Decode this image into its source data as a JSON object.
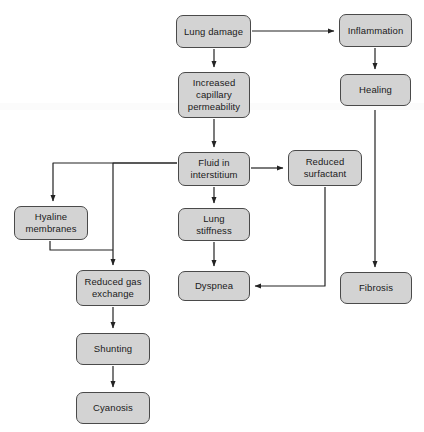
{
  "diagram": {
    "background_color": "#ffffff",
    "node_fill_color": "#d3d3d3",
    "node_border_color": "#4a4a4a",
    "edge_color": "#222222",
    "text_color": "#1a1a1a",
    "nodes": [
      {
        "id": "lung-damage",
        "label": "Lung damage",
        "x": 176,
        "y": 15,
        "w": 75,
        "h": 33
      },
      {
        "id": "inflammation",
        "label": "Inflammation",
        "x": 339,
        "y": 14,
        "w": 73,
        "h": 33
      },
      {
        "id": "increased-cap-perm",
        "label": "Increased\ncapillary\npermeability",
        "x": 178,
        "y": 72,
        "w": 72,
        "h": 46
      },
      {
        "id": "healing",
        "label": "Healing",
        "x": 340,
        "y": 74,
        "w": 71,
        "h": 32
      },
      {
        "id": "fluid-interstitium",
        "label": "Fluid in\ninterstitium",
        "x": 178,
        "y": 152,
        "w": 72,
        "h": 34
      },
      {
        "id": "reduced-surfactant",
        "label": "Reduced\nsurfactant",
        "x": 288,
        "y": 150,
        "w": 74,
        "h": 36
      },
      {
        "id": "hyaline-membranes",
        "label": "Hyaline\nmembranes",
        "x": 14,
        "y": 206,
        "w": 74,
        "h": 34
      },
      {
        "id": "lung-stiffness",
        "label": "Lung\nstiffness",
        "x": 178,
        "y": 208,
        "w": 72,
        "h": 33
      },
      {
        "id": "reduced-gas-exch",
        "label": "Reduced gas\nexchange",
        "x": 76,
        "y": 270,
        "w": 74,
        "h": 36
      },
      {
        "id": "dyspnea",
        "label": "Dyspnea",
        "x": 178,
        "y": 271,
        "w": 72,
        "h": 30
      },
      {
        "id": "fibrosis",
        "label": "Fibrosis",
        "x": 340,
        "y": 272,
        "w": 72,
        "h": 32
      },
      {
        "id": "shunting",
        "label": "Shunting",
        "x": 76,
        "y": 333,
        "w": 74,
        "h": 32
      },
      {
        "id": "cyanosis",
        "label": "Cyanosis",
        "x": 76,
        "y": 392,
        "w": 74,
        "h": 32
      }
    ],
    "edges": [
      {
        "id": "lung-damage-to-inflammation",
        "from": "lung-damage",
        "to": "inflammation",
        "points": "252,31 334,31",
        "arrow": true
      },
      {
        "id": "lung-damage-to-capillary",
        "from": "lung-damage",
        "to": "increased-cap-perm",
        "points": "214,49 214,67",
        "arrow": true
      },
      {
        "id": "inflammation-to-healing",
        "from": "inflammation",
        "to": "healing",
        "points": "375,48 375,69",
        "arrow": true
      },
      {
        "id": "capillary-to-fluid",
        "from": "increased-cap-perm",
        "to": "fluid-interstitium",
        "points": "214,119 214,147",
        "arrow": true
      },
      {
        "id": "healing-to-fibrosis",
        "from": "healing",
        "to": "fibrosis",
        "points": "375,107 375,267",
        "arrow": true
      },
      {
        "id": "fluid-to-surfactant",
        "from": "fluid-interstitium",
        "to": "reduced-surfactant",
        "points": "251,168 283,168",
        "arrow": true
      },
      {
        "id": "fluid-to-hyaline",
        "from": "fluid-interstitium",
        "to": "hyaline-membranes",
        "points": "177,163 53,163 53,201",
        "arrow": true
      },
      {
        "id": "fluid-to-reduced-gas-exchange",
        "from": "fluid-interstitium",
        "to": "reduced-gas-exch",
        "points": "177,163 113,163 113,265",
        "arrow": true
      },
      {
        "id": "fluid-to-lung-stiffness",
        "from": "fluid-interstitium",
        "to": "lung-stiffness",
        "points": "214,187 214,203",
        "arrow": true
      },
      {
        "id": "hyaline-to-reduced-gas-exchange",
        "from": "hyaline-membranes",
        "to": "reduced-gas-exch",
        "points": "50,241 50,250 113,250",
        "arrow": false
      },
      {
        "id": "lung-stiffness-to-dyspnea",
        "from": "lung-stiffness",
        "to": "dyspnea",
        "points": "214,242 214,266",
        "arrow": true
      },
      {
        "id": "surfactant-to-dyspnea",
        "from": "reduced-surfactant",
        "to": "dyspnea",
        "points": "325,187 325,286 255,286",
        "arrow": true
      },
      {
        "id": "reduced-gas-exchange-to-shunting",
        "from": "reduced-gas-exch",
        "to": "shunting",
        "points": "113,307 113,328",
        "arrow": true
      },
      {
        "id": "shunting-to-cyanosis",
        "from": "shunting",
        "to": "cyanosis",
        "points": "113,366 113,387",
        "arrow": true
      }
    ]
  }
}
